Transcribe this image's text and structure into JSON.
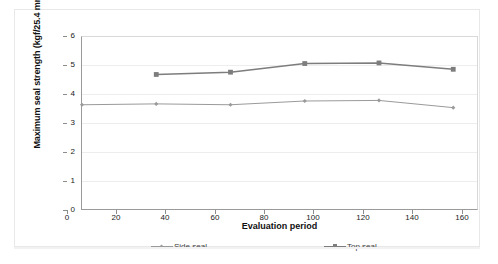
{
  "chart_data": {
    "type": "line",
    "title": "",
    "xlabel": "Evaluation period",
    "ylabel": "Maximum seal strength (kgf/25.4 mm)",
    "xlim": [
      0,
      160
    ],
    "ylim": [
      0,
      6
    ],
    "xticks": [
      0,
      20,
      40,
      60,
      80,
      100,
      120,
      140,
      160
    ],
    "yticks": [
      0,
      1,
      2,
      3,
      4,
      5,
      6
    ],
    "grid": "horizontal",
    "legend_position": "bottom",
    "series": [
      {
        "name": "Side seal",
        "color": "#9a9a9a",
        "marker": "diamond",
        "x": [
          0,
          30,
          60,
          90,
          120,
          150
        ],
        "values": [
          3.65,
          3.68,
          3.65,
          3.78,
          3.8,
          3.55
        ]
      },
      {
        "name": "Top seal",
        "color": "#7d7d7d",
        "marker": "square",
        "x": [
          30,
          60,
          90,
          120,
          150
        ],
        "values": [
          4.7,
          4.78,
          5.08,
          5.1,
          4.88
        ]
      }
    ]
  },
  "axes": {
    "y_title": "Maximum seal strength (kgf/25.4 mm)",
    "x_title": "Evaluation period",
    "y_tick_labels": [
      "6",
      "5",
      "4",
      "3",
      "2",
      "1",
      "0"
    ],
    "x_tick_labels": [
      "0",
      "20",
      "40",
      "60",
      "80",
      "100",
      "120",
      "140",
      "160"
    ]
  },
  "legend": {
    "items": [
      {
        "label": "Side seal"
      },
      {
        "label": "Top seal"
      }
    ]
  },
  "colors": {
    "side_seal": "#9a9a9a",
    "top_seal": "#7d7d7d",
    "axis": "#9a9a9a",
    "grid": "#ededed",
    "frame": "#e8e8e8"
  }
}
